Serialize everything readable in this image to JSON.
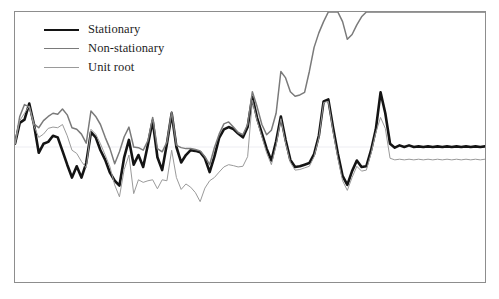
{
  "figure": {
    "background_color": "#ffffff",
    "frame_color": "#8d8d8d",
    "gridline_color": "#ededf2"
  },
  "legend": {
    "position": "top-left",
    "entries": [
      {
        "label": "Stationary",
        "color": "#141414",
        "width": 2.6,
        "swatch_name": "legend-swatch-stationary"
      },
      {
        "label": "Non-stationary",
        "color": "#7a7a7a",
        "width": 1.5,
        "swatch_name": "legend-swatch-non-stationary"
      },
      {
        "label": "Unit root",
        "color": "#9a9a9a",
        "width": 1.0,
        "swatch_name": "legend-swatch-unit-root"
      }
    ]
  },
  "chart_data": {
    "type": "line",
    "title": "",
    "xlabel": "",
    "ylabel": "",
    "grid": true,
    "legend_position": "top-left",
    "xlim": [
      0,
      99
    ],
    "ylim": [
      -4.2,
      4.2
    ],
    "gridlines_y": [
      0
    ],
    "x": [
      0,
      1,
      2,
      3,
      4,
      5,
      6,
      7,
      8,
      9,
      10,
      11,
      12,
      13,
      14,
      15,
      16,
      17,
      18,
      19,
      20,
      21,
      22,
      23,
      24,
      25,
      26,
      27,
      28,
      29,
      30,
      31,
      32,
      33,
      34,
      35,
      36,
      37,
      38,
      39,
      40,
      41,
      42,
      43,
      44,
      45,
      46,
      47,
      48,
      49,
      50,
      51,
      52,
      53,
      54,
      55,
      56,
      57,
      58,
      59,
      60,
      61,
      62,
      63,
      64,
      65,
      66,
      67,
      68,
      69,
      70,
      71,
      72,
      73,
      74,
      75,
      76,
      77,
      78,
      79,
      80,
      81,
      82,
      83,
      84,
      85,
      86,
      87,
      88,
      89,
      90,
      91,
      92,
      93,
      94,
      95,
      96,
      97,
      98,
      99
    ],
    "series": [
      {
        "name": "Stationary",
        "color": "#141414",
        "width": 2.6,
        "values": [
          0.1,
          0.75,
          0.85,
          1.35,
          0.7,
          -0.18,
          0.1,
          0.16,
          0.35,
          0.3,
          -0.12,
          -0.55,
          -0.95,
          -0.6,
          -0.95,
          -0.5,
          0.46,
          0.3,
          -0.1,
          -0.4,
          -0.8,
          -1.05,
          -1.2,
          -0.32,
          0.22,
          -0.55,
          -0.25,
          -0.62,
          0.08,
          0.82,
          -0.32,
          -0.72,
          0.1,
          1.05,
          0.0,
          -0.48,
          -0.25,
          -0.1,
          -0.12,
          -0.16,
          -0.35,
          -0.78,
          -0.3,
          0.28,
          0.55,
          0.62,
          0.56,
          0.42,
          0.3,
          0.62,
          1.55,
          0.9,
          0.42,
          -0.05,
          -0.42,
          0.18,
          0.95,
          0.22,
          -0.4,
          -0.62,
          -0.6,
          -0.55,
          -0.5,
          -0.22,
          0.35,
          1.42,
          1.48,
          0.6,
          -0.2,
          -0.9,
          -1.18,
          -0.75,
          -0.42,
          -0.62,
          -0.6,
          -0.1,
          0.55,
          1.7,
          1.05,
          0.1,
          -0.02,
          0.05,
          0.0,
          0.05,
          0.0,
          0.02,
          0.0,
          0.02,
          0.0,
          0.02,
          0.0,
          0.02,
          0.0,
          0.02,
          0.0,
          0.02,
          0.0,
          0.02,
          0.0,
          0.02
        ]
      },
      {
        "name": "Non-stationary",
        "color": "#7a7a7a",
        "width": 1.5,
        "values": [
          0.1,
          0.95,
          1.32,
          1.25,
          0.72,
          0.6,
          0.82,
          0.95,
          1.05,
          1.02,
          1.18,
          1.0,
          0.6,
          0.55,
          0.4,
          0.12,
          1.12,
          0.95,
          0.7,
          0.3,
          -0.05,
          -0.52,
          -0.15,
          0.32,
          0.62,
          0.0,
          -0.02,
          -0.1,
          0.2,
          0.92,
          -0.05,
          -0.15,
          0.15,
          1.1,
          0.05,
          -0.02,
          -0.05,
          -0.05,
          -0.08,
          -0.12,
          -0.3,
          -0.55,
          -0.02,
          0.4,
          0.72,
          0.78,
          0.62,
          0.45,
          0.38,
          0.7,
          1.72,
          1.25,
          0.7,
          0.38,
          0.52,
          1.05,
          2.35,
          2.15,
          1.72,
          1.58,
          1.62,
          1.7,
          2.35,
          3.1,
          3.55,
          3.9,
          4.2,
          4.2,
          4.2,
          3.9,
          3.35,
          3.5,
          3.8,
          4.05,
          4.2,
          4.2,
          4.2,
          4.2,
          4.2,
          4.2,
          4.2,
          4.2,
          4.2,
          4.2,
          4.2,
          4.2,
          4.2,
          4.2,
          4.2,
          4.2,
          4.2,
          4.2,
          4.2,
          4.2,
          4.2,
          4.2,
          4.2,
          4.2,
          4.2,
          4.2
        ]
      },
      {
        "name": "Unit root",
        "color": "#9a9a9a",
        "width": 1.0,
        "values": [
          0.1,
          0.82,
          1.05,
          1.28,
          0.65,
          0.3,
          0.4,
          0.58,
          0.62,
          0.6,
          0.7,
          0.35,
          -0.1,
          -0.2,
          -0.45,
          -0.65,
          0.55,
          0.4,
          0.1,
          -0.25,
          -0.62,
          -1.18,
          -1.55,
          -0.7,
          -0.25,
          -1.45,
          -1.02,
          -1.1,
          -1.05,
          -1.02,
          -1.3,
          -1.02,
          -1.05,
          -0.1,
          -0.95,
          -1.32,
          -1.15,
          -1.25,
          -1.42,
          -1.7,
          -1.28,
          -1.05,
          -0.95,
          -0.78,
          -0.62,
          -0.55,
          -0.58,
          -0.62,
          -0.6,
          -0.3,
          1.45,
          0.82,
          0.32,
          -0.18,
          -0.55,
          0.05,
          0.88,
          0.12,
          -0.48,
          -0.72,
          -0.7,
          -0.65,
          -0.6,
          -0.3,
          0.28,
          1.38,
          1.42,
          0.48,
          -0.35,
          -1.05,
          -1.35,
          -0.95,
          -0.6,
          -0.75,
          -0.72,
          -0.2,
          0.45,
          0.92,
          0.58,
          -0.35,
          -0.4,
          -0.38,
          -0.4,
          -0.38,
          -0.4,
          -0.38,
          -0.4,
          -0.38,
          -0.4,
          -0.38,
          -0.4,
          -0.38,
          -0.4,
          -0.38,
          -0.4,
          -0.38,
          -0.4,
          -0.38,
          -0.4,
          -0.38
        ]
      }
    ]
  }
}
